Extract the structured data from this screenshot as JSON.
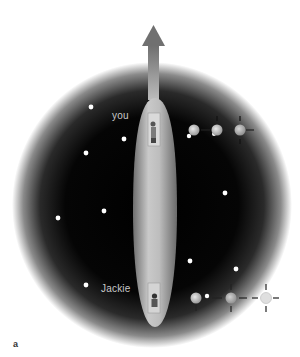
{
  "figure": {
    "panel_label": "a",
    "labels": {
      "top_observer": "you",
      "bottom_observer": "Jackie"
    },
    "colors": {
      "background": "#ffffff",
      "sphere_core": "#000000",
      "sphere_edge": "#ffffff",
      "capsule": "#b8b8b8",
      "arrow": "#8a8a8a",
      "star": "#ffffff",
      "label_text": "#c8c8c8"
    },
    "sphere": {
      "cx": 152,
      "cy": 205,
      "rx": 140,
      "ry": 143
    },
    "arrow": {
      "direction": "up",
      "tip_y": 25,
      "base_y": 98
    },
    "capsule": {
      "x": 133,
      "y": 98,
      "w": 44,
      "h": 229
    },
    "stars": [
      {
        "x": 91,
        "y": 107
      },
      {
        "x": 124,
        "y": 139
      },
      {
        "x": 86,
        "y": 153
      },
      {
        "x": 58,
        "y": 218
      },
      {
        "x": 104,
        "y": 211
      },
      {
        "x": 225,
        "y": 193
      },
      {
        "x": 190,
        "y": 261
      },
      {
        "x": 236,
        "y": 269
      },
      {
        "x": 86,
        "y": 285
      },
      {
        "x": 207,
        "y": 296
      },
      {
        "x": 189,
        "y": 136
      },
      {
        "x": 214,
        "y": 134
      }
    ],
    "light_sequences": [
      {
        "row": "top",
        "y": 130,
        "x_positions": [
          194,
          217,
          240
        ],
        "fades": [
          0.85,
          0.8,
          0.75
        ]
      },
      {
        "row": "bottom",
        "y": 298,
        "x_positions": [
          196,
          231,
          266
        ],
        "fades": [
          0.85,
          0.7,
          0.45
        ]
      }
    ]
  }
}
